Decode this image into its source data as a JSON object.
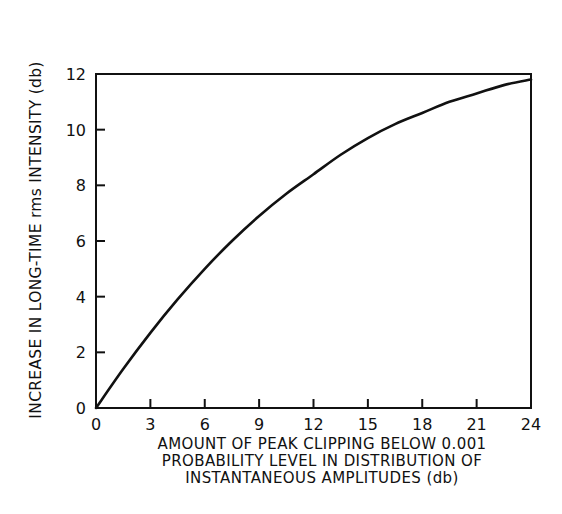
{
  "chart_data": {
    "type": "line",
    "title": "",
    "xlabel": "AMOUNT OF PEAK CLIPPING BELOW 0.001 PROBABILITY LEVEL IN DISTRIBUTION OF INSTANTANEOUS AMPLITUDES (db)",
    "xlabel_lines": [
      "AMOUNT OF PEAK CLIPPING BELOW 0.001",
      "PROBABILITY LEVEL IN DISTRIBUTION OF",
      "INSTANTANEOUS AMPLITUDES (db)"
    ],
    "ylabel": "INCREASE IN LONG-TIME rms INTENSITY (db)",
    "xlim": [
      0,
      24
    ],
    "ylim": [
      0,
      12
    ],
    "xticks": [
      0,
      3,
      6,
      9,
      12,
      15,
      18,
      21,
      24
    ],
    "yticks": [
      0,
      2,
      4,
      6,
      8,
      10,
      12
    ],
    "grid": false,
    "legend": null,
    "series": [
      {
        "name": "rms intensity increase",
        "x": [
          0,
          1.5,
          3,
          4.5,
          6,
          7.5,
          9,
          10.5,
          12,
          13.5,
          15,
          16.5,
          18,
          19.5,
          21,
          22.5,
          24
        ],
        "values": [
          0,
          1.4,
          2.7,
          3.9,
          5.0,
          6.0,
          6.9,
          7.7,
          8.4,
          9.1,
          9.7,
          10.2,
          10.6,
          11.0,
          11.3,
          11.6,
          11.8
        ]
      }
    ]
  }
}
